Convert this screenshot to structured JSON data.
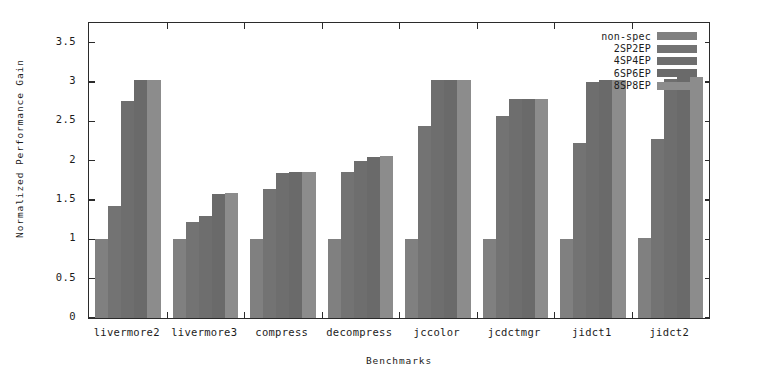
{
  "chart_data": {
    "type": "bar",
    "title": "",
    "xlabel": "Benchmarks",
    "ylabel": "Normalized Performance Gain",
    "categories": [
      "livermore2",
      "livermore3",
      "compress",
      "decompress",
      "jccolor",
      "jcdctmgr",
      "jidct1",
      "jidct2"
    ],
    "series": [
      {
        "name": "non-spec",
        "color": "#808080",
        "values": [
          1.0,
          1.0,
          1.0,
          1.0,
          1.0,
          1.0,
          1.0,
          1.02
        ]
      },
      {
        "name": "2SP2EP",
        "color": "#737373",
        "values": [
          1.43,
          1.22,
          1.64,
          1.85,
          2.44,
          2.57,
          2.22,
          2.27
        ]
      },
      {
        "name": "4SP4EP",
        "color": "#6e6e6e",
        "values": [
          2.76,
          1.3,
          1.84,
          2.0,
          3.02,
          2.79,
          3.0,
          3.04
        ]
      },
      {
        "name": "6SP6EP",
        "color": "#6a6a6a",
        "values": [
          3.02,
          1.58,
          1.85,
          2.05,
          3.02,
          2.79,
          3.02,
          3.06
        ]
      },
      {
        "name": "8SP8EP",
        "color": "#8c8c8c",
        "values": [
          3.02,
          1.59,
          1.85,
          2.06,
          3.02,
          2.79,
          3.02,
          3.06
        ]
      }
    ],
    "ylim": [
      0,
      3.75
    ],
    "yticks": [
      "0",
      "0.5",
      "1",
      "1.5",
      "2",
      "2.5",
      "3",
      "3.5"
    ],
    "ytick_values": [
      0,
      0.5,
      1,
      1.5,
      2,
      2.5,
      3,
      3.5
    ],
    "grid": false,
    "legend_position": "top-right",
    "axis_color": "#2b2b2b",
    "background": "#ffffff"
  }
}
